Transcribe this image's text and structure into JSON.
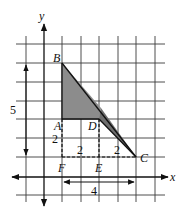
{
  "diagram": {
    "axes": {
      "x_label": "x",
      "y_label": "y"
    },
    "points": {
      "A": {
        "label": "A",
        "grid": [
          1,
          2
        ]
      },
      "B": {
        "label": "B",
        "grid": [
          1,
          5
        ]
      },
      "C": {
        "label": "C",
        "grid": [
          5,
          0
        ]
      },
      "D": {
        "label": "D",
        "grid": [
          3,
          2
        ]
      },
      "E": {
        "label": "E",
        "grid": [
          3,
          0
        ]
      },
      "F": {
        "label": "F",
        "grid": [
          1,
          0
        ]
      }
    },
    "measurements": {
      "vertical_BF": "5",
      "AF": "2",
      "FE": "2",
      "EC": "2",
      "FC": "4"
    },
    "colors": {
      "shade_light": "#8c8c8c",
      "shade_dark": "#6e6e6e",
      "line": "#111111",
      "grid": "#3a3a3a"
    }
  }
}
